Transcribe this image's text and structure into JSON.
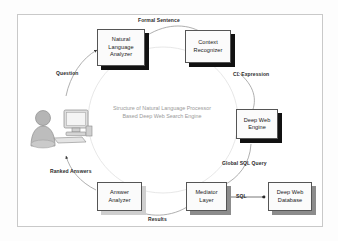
{
  "diagram": {
    "caption_line1": "Structure of Natural Language Processor",
    "caption_line2": "Based Deep Web Search Engine",
    "nodes": [
      {
        "id": "natural-language-analyzer",
        "lines": [
          "Natural",
          "Language",
          "Analyzer"
        ],
        "shadow": "dark"
      },
      {
        "id": "context-recognizer",
        "lines": [
          "Context",
          "Recognizer"
        ],
        "shadow": "dark"
      },
      {
        "id": "deep-web-engine",
        "lines": [
          "Deep Web",
          "Engine"
        ],
        "shadow": "dark"
      },
      {
        "id": "answer-analyzer",
        "lines": [
          "Answer",
          "Analyzer"
        ],
        "shadow": "light"
      },
      {
        "id": "mediator-layer",
        "lines": [
          "Mediator",
          "Layer"
        ],
        "shadow": "mid"
      },
      {
        "id": "deep-web-database",
        "lines": [
          "Deep Web",
          "Database"
        ],
        "shadow": "mid"
      }
    ],
    "edge_labels": [
      {
        "id": "formal-sentence",
        "text": "Formal Sentence"
      },
      {
        "id": "cl-expression",
        "text": "CL Expression"
      },
      {
        "id": "global-sql-query",
        "text": "Global SQL Query"
      },
      {
        "id": "sql",
        "text": "SQL"
      },
      {
        "id": "results",
        "text": "Results"
      },
      {
        "id": "ranked-answers",
        "text": "Ranked Answers"
      },
      {
        "id": "question",
        "text": "Question"
      }
    ],
    "actor": {
      "person_icon": "user-person-icon",
      "computer_icon": "desktop-computer-icon"
    },
    "colors": {
      "box_border": "#555555",
      "box_fill": "#fbfbfb",
      "shadow_dark": "#111111",
      "shadow_mid": "#8c8c8c",
      "shadow_light": "#cfcfcf",
      "caption_text": "#9a9a9a",
      "edge_stroke": "#8a8a8a",
      "frame_border": "#c9c9c9"
    }
  }
}
